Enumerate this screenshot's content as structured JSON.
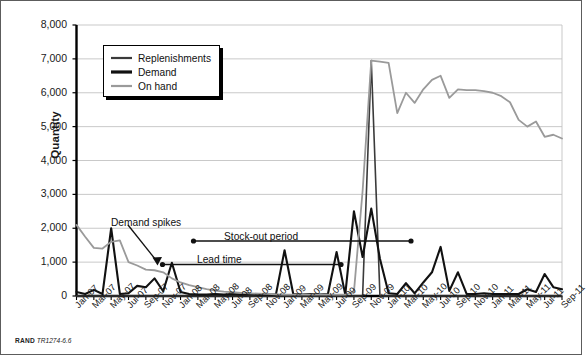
{
  "figure": {
    "credit_prefix": "RAND",
    "credit_id": "TR1274-6.6",
    "frame_color": "#5c5c5c"
  },
  "annotations": [
    {
      "id": "demand-spikes",
      "text": "Demand spikes",
      "x": 110,
      "y": 216
    },
    {
      "id": "stock-out-period",
      "text": "Stock-out period",
      "x": 223,
      "y": 230
    },
    {
      "id": "lead-time",
      "text": "Lead time",
      "x": 196,
      "y": 253
    }
  ],
  "legend": {
    "items": [
      {
        "label": "Replenishments",
        "color": "#3a3a3a",
        "width": 2.2
      },
      {
        "label": "Demand",
        "color": "#111111",
        "width": 3.2
      },
      {
        "label": "On hand",
        "color": "#9a9a9a",
        "width": 2.2
      }
    ]
  },
  "chart_data": {
    "type": "line",
    "title": "",
    "xlabel": "",
    "ylabel": "Quantity",
    "ylim": [
      0,
      8000
    ],
    "ytick_labels": [
      "0",
      "1,000",
      "2,000",
      "3,000",
      "4,000",
      "5,000",
      "6,000",
      "7,000",
      "8,000"
    ],
    "ytick_values": [
      0,
      1000,
      2000,
      3000,
      4000,
      5000,
      6000,
      7000,
      8000
    ],
    "grid": true,
    "legend_position": "upper-left-inside",
    "categories": [
      "Jan-07",
      "Feb-07",
      "Mar-07",
      "Apr-07",
      "May-07",
      "Jun-07",
      "Jul-07",
      "Aug-07",
      "Sep-07",
      "Oct-07",
      "Nov-07",
      "Dec-07",
      "Jan-08",
      "Feb-08",
      "Mar-08",
      "Apr-08",
      "May-08",
      "Jun-08",
      "Jul-08",
      "Aug-08",
      "Sep-08",
      "Oct-08",
      "Nov-08",
      "Dec-08",
      "Jan-09",
      "Feb-09",
      "Mar-09",
      "Apr-09",
      "May-09",
      "Jun-09",
      "Jul-09",
      "Aug-09",
      "Sep-09",
      "Oct-09",
      "Nov-09",
      "Dec-09",
      "Jan-10",
      "Feb-10",
      "Mar-10",
      "Apr-10",
      "May-10",
      "Jun-10",
      "Jul-10",
      "Aug-10",
      "Sep-10",
      "Oct-10",
      "Nov-10",
      "Dec-10",
      "Jan-11",
      "Feb-11",
      "Mar-11",
      "Apr-11",
      "May-11",
      "Jun-11",
      "Jul-11",
      "Aug-11",
      "Sep-11"
    ],
    "xtick_labels": [
      "Jan-07",
      "Mar-07",
      "May-07",
      "Jul-07",
      "Sep-07",
      "Nov-07",
      "Jan-08",
      "Mar-08",
      "May-08",
      "Jul-08",
      "Sep-08",
      "Nov-08",
      "Jan-09",
      "Mar-09",
      "May-09",
      "Jul-09",
      "Sep-09",
      "Nov-09",
      "Jan-10",
      "Mar-10",
      "May-10",
      "Jul-10",
      "Sep-10",
      "Nov-10",
      "Jan-11",
      "Mar-11",
      "May-11",
      "Jul-11",
      "Sep-11"
    ],
    "series": [
      {
        "name": "Replenishments",
        "color": "#3a3a3a",
        "width": 1.6,
        "values": [
          0,
          0,
          0,
          0,
          0,
          0,
          0,
          0,
          0,
          0,
          0,
          0,
          0,
          0,
          0,
          0,
          0,
          0,
          0,
          0,
          0,
          0,
          0,
          0,
          0,
          0,
          0,
          0,
          0,
          0,
          0,
          0,
          0,
          0,
          6950,
          0,
          0,
          0,
          0,
          0,
          0,
          0,
          0,
          0,
          0,
          0,
          0,
          0,
          0,
          0,
          0,
          0,
          0,
          0,
          0,
          0,
          0
        ]
      },
      {
        "name": "Demand",
        "color": "#111111",
        "width": 2.1,
        "values": [
          120,
          60,
          180,
          60,
          2000,
          60,
          80,
          300,
          260,
          520,
          140,
          980,
          120,
          60,
          40,
          40,
          60,
          40,
          60,
          40,
          60,
          40,
          40,
          40,
          1350,
          60,
          40,
          60,
          40,
          60,
          1300,
          40,
          2500,
          1150,
          2580,
          1100,
          80,
          60,
          380,
          80,
          400,
          700,
          1450,
          150,
          700,
          60,
          60,
          80,
          60,
          60,
          60,
          60,
          200,
          120,
          650,
          260,
          200
        ]
      },
      {
        "name": "On hand",
        "color": "#9a9a9a",
        "width": 1.8,
        "values": [
          2100,
          1750,
          1420,
          1400,
          1600,
          1640,
          1000,
          900,
          780,
          760,
          700,
          520,
          400,
          320,
          260,
          200,
          160,
          130,
          110,
          90,
          80,
          70,
          60,
          50,
          40,
          40,
          40,
          40,
          40,
          40,
          40,
          40,
          120,
          3100,
          6950,
          6920,
          6880,
          5400,
          6000,
          5700,
          6100,
          6380,
          6500,
          5850,
          6100,
          6080,
          6080,
          6050,
          6000,
          5900,
          5720,
          5200,
          5000,
          5150,
          4700,
          4760,
          4650
        ]
      }
    ],
    "callouts": [
      {
        "label": "Demand spikes",
        "target_category": "Nov-07"
      },
      {
        "label": "Lead time",
        "from_category": "Nov-07",
        "to_category": "Jul-09"
      },
      {
        "label": "Stock-out period",
        "from_category": "Mar-08",
        "to_category": "Nov-09"
      }
    ]
  }
}
